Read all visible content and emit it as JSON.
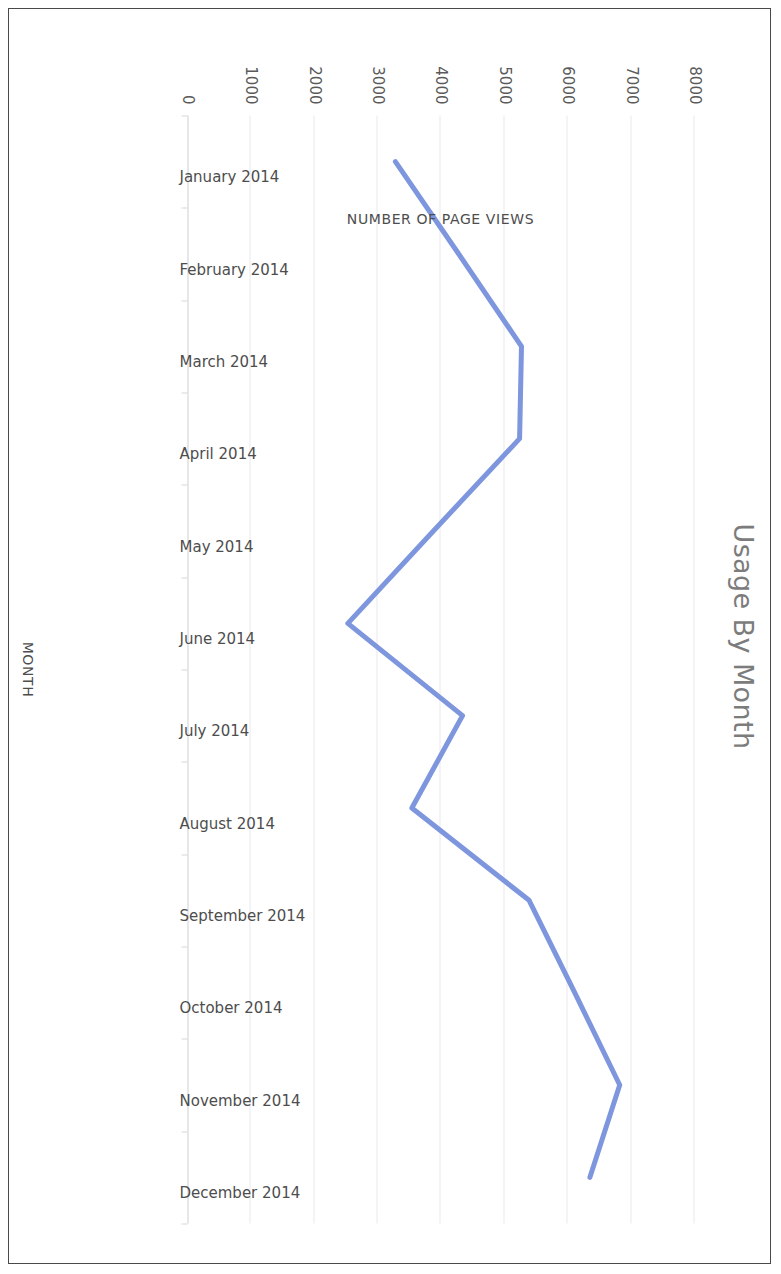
{
  "chart_data": {
    "type": "line",
    "title": "Usage By Month",
    "xlabel": "MONTH",
    "ylabel": "NUMBER OF PAGE VIEWS",
    "categories": [
      "January 2014",
      "February 2014",
      "March 2014",
      "April 2014",
      "May 2014",
      "June 2014",
      "July 2014",
      "August 2014",
      "September 2014",
      "October 2014",
      "November 2014",
      "December 2014"
    ],
    "values": [
      3280,
      4280,
      5270,
      5240,
      3880,
      2530,
      4340,
      3540,
      5390,
      6110,
      6820,
      6350
    ],
    "ylim": [
      0,
      8000
    ],
    "yticks": [
      "0",
      "1000",
      "2000",
      "3000",
      "4000",
      "5000",
      "6000",
      "7000",
      "8000"
    ],
    "ytick_values": [
      0,
      1000,
      2000,
      3000,
      4000,
      5000,
      6000,
      7000,
      8000
    ],
    "grid": true,
    "legend": "none",
    "series_color": "#7d96dd",
    "title_color": "#7c7c7c",
    "axis_text_color": "#4d4d4d",
    "gridline_color": "#e9e9ee",
    "orientation_note": "page rendered upside down (rotated 180 degrees)"
  },
  "page": {
    "border_color": "#4a4a4a",
    "background": "#ffffff"
  }
}
